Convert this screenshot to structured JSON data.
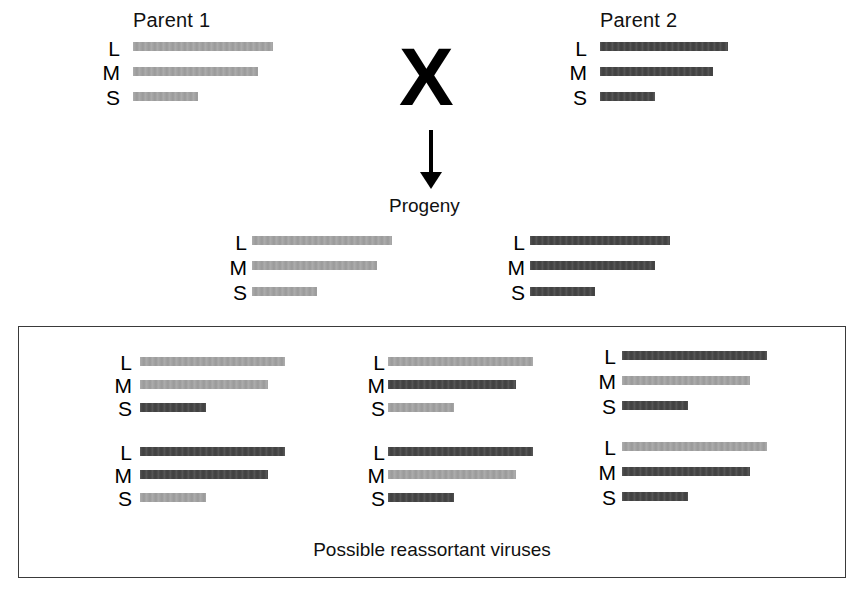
{
  "figure": {
    "cross_symbol": "X",
    "progeny_label": "Progeny",
    "reassortant_caption": "Possible reassortant viruses"
  },
  "colors": {
    "parent1_segment": "#a3a3a3",
    "parent2_segment": "#454545",
    "background": "#ffffff",
    "text": "#000000",
    "box_border": "#3a3a3a"
  },
  "segment_labels": {
    "large": "L",
    "medium": "M",
    "small": "S"
  },
  "parents": [
    {
      "name": "Parent 1",
      "origin": "parent1",
      "segments": [
        {
          "label": "L",
          "origin": "parent1",
          "length": 140
        },
        {
          "label": "M",
          "origin": "parent1",
          "length": 125
        },
        {
          "label": "S",
          "origin": "parent1",
          "length": 65
        }
      ]
    },
    {
      "name": "Parent 2",
      "origin": "parent2",
      "segments": [
        {
          "label": "L",
          "origin": "parent2",
          "length": 128
        },
        {
          "label": "M",
          "origin": "parent2",
          "length": 113
        },
        {
          "label": "S",
          "origin": "parent2",
          "length": 55
        }
      ]
    }
  ],
  "progeny": [
    {
      "name": "Progeny parental type 1",
      "segments": [
        {
          "label": "L",
          "origin": "parent1",
          "length": 140
        },
        {
          "label": "M",
          "origin": "parent1",
          "length": 125
        },
        {
          "label": "S",
          "origin": "parent1",
          "length": 65
        }
      ]
    },
    {
      "name": "Progeny parental type 2",
      "segments": [
        {
          "label": "L",
          "origin": "parent2",
          "length": 140
        },
        {
          "label": "M",
          "origin": "parent2",
          "length": 125
        },
        {
          "label": "S",
          "origin": "parent2",
          "length": 65
        }
      ]
    }
  ],
  "reassortants": [
    {
      "name": "Reassortant 1",
      "segments": [
        {
          "label": "L",
          "origin": "parent1",
          "length": 145
        },
        {
          "label": "M",
          "origin": "parent1",
          "length": 128
        },
        {
          "label": "S",
          "origin": "parent2",
          "length": 66
        }
      ]
    },
    {
      "name": "Reassortant 2",
      "segments": [
        {
          "label": "L",
          "origin": "parent1",
          "length": 145
        },
        {
          "label": "M",
          "origin": "parent2",
          "length": 128
        },
        {
          "label": "S",
          "origin": "parent1",
          "length": 66
        }
      ]
    },
    {
      "name": "Reassortant 3",
      "segments": [
        {
          "label": "L",
          "origin": "parent2",
          "length": 145
        },
        {
          "label": "M",
          "origin": "parent1",
          "length": 128
        },
        {
          "label": "S",
          "origin": "parent2",
          "length": 66
        }
      ]
    },
    {
      "name": "Reassortant 4",
      "segments": [
        {
          "label": "L",
          "origin": "parent2",
          "length": 145
        },
        {
          "label": "M",
          "origin": "parent2",
          "length": 128
        },
        {
          "label": "S",
          "origin": "parent1",
          "length": 66
        }
      ]
    },
    {
      "name": "Reassortant 5",
      "segments": [
        {
          "label": "L",
          "origin": "parent2",
          "length": 145
        },
        {
          "label": "M",
          "origin": "parent1",
          "length": 128
        },
        {
          "label": "S",
          "origin": "parent2",
          "length": 66
        }
      ]
    },
    {
      "name": "Reassortant 6",
      "segments": [
        {
          "label": "L",
          "origin": "parent1",
          "length": 145
        },
        {
          "label": "M",
          "origin": "parent2",
          "length": 128
        },
        {
          "label": "S",
          "origin": "parent2",
          "length": 66
        }
      ]
    }
  ]
}
